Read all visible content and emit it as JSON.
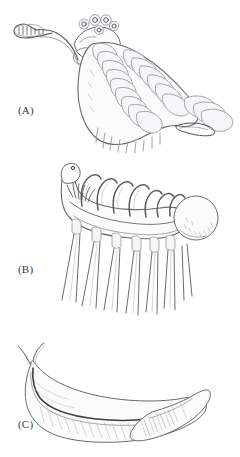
{
  "figure": {
    "kind": "scientific-illustration-plate",
    "medium": "pencil line drawing",
    "background_color": "#ffffff",
    "ink_color": "#5b5b5e",
    "panel_count": 3,
    "orientation": "vertical stack"
  },
  "panels": [
    {
      "id": "a",
      "label": "(A)",
      "subject": "segmented lobopodian with anterior proboscis",
      "features": [
        "elongate frontal proboscis with clawed terminal spines",
        "cluster of stalked eyes on head",
        "series of overlapping lateral body lobes",
        "paired ventral walking appendages",
        "fan-shaped tail flukes"
      ],
      "lobe_count": 15,
      "eye_count": 5,
      "tail_blade_count": 3
    },
    {
      "id": "b",
      "label": "(B)",
      "subject": "spined lobopodian with dorsal tentacles",
      "features": [
        "curved raised anterior neck with simple head",
        "row of flexible dorsal tentacles",
        "paired rigid conical spines on sockets",
        "tuft of fine filaments behind head",
        "bulbous stippled posterior globe"
      ],
      "tentacle_count": 7,
      "spine_pair_count": 7,
      "has_posterior_bulb": true
    },
    {
      "id": "c",
      "label": "(C)",
      "subject": "soft-bodied worm with paired head tentacles",
      "features": [
        "two slender forked anterior tentacles",
        "smooth elongate trunk",
        "dark longitudinal gut trace",
        "fine oblique body striations",
        "pointed lanceolate posterior fin"
      ],
      "tentacle_count": 2,
      "has_tail_fin": true
    }
  ]
}
